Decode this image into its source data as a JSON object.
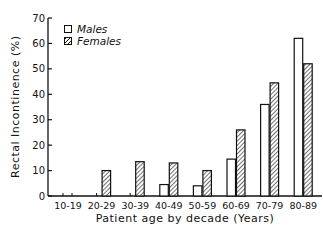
{
  "chart_data": {
    "type": "bar",
    "title": "",
    "xlabel": "Patient age by decade (Years)",
    "ylabel": "Rectal Incontinence (%)",
    "ylim": [
      0,
      70
    ],
    "yticks": [
      0,
      10,
      20,
      30,
      40,
      50,
      60,
      70
    ],
    "grid": false,
    "legend_position": "upper-left",
    "categories": [
      "10-19",
      "20-29",
      "30-39",
      "40-49",
      "50-59",
      "60-69",
      "70-79",
      "80-89"
    ],
    "series": [
      {
        "name": "Males",
        "pattern": "open",
        "values": [
          0,
          0,
          0,
          4.5,
          4,
          14.5,
          36,
          62
        ]
      },
      {
        "name": "Females",
        "pattern": "hatched",
        "values": [
          0,
          10,
          13.5,
          13,
          10,
          26,
          44.5,
          52
        ]
      }
    ]
  },
  "labels": {
    "ylabel": "Rectal Incontinence (%)",
    "xlabel": "Patient age by decade (Years)",
    "legend_males": "Males",
    "legend_females": "Females"
  }
}
